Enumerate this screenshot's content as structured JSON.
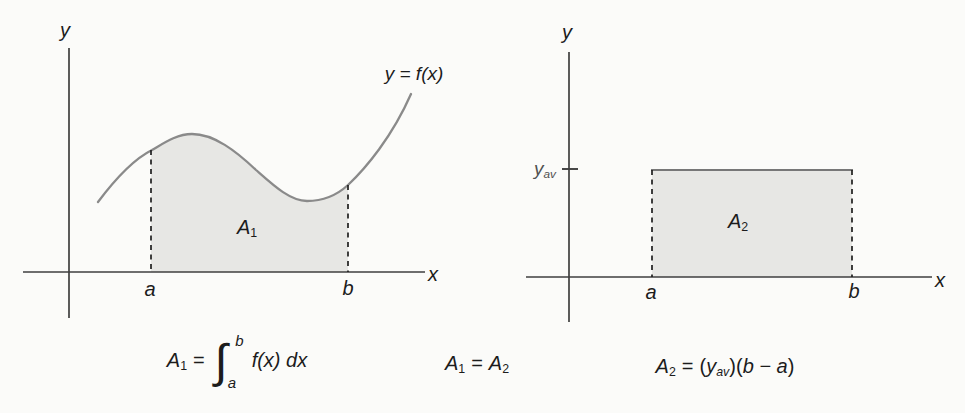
{
  "colors": {
    "background": "#fbfbf9",
    "axis": "#3f3f3f",
    "curve": "#8a8a8a",
    "area_fill": "#e7e7e4",
    "dash": "#1f1f1f",
    "rect_top": "#777777",
    "text": "#1c1c1c",
    "yav_text": "#505050"
  },
  "left_graph": {
    "y_axis_label": "y",
    "x_axis_label": "x",
    "curve_label": "y = f(x)",
    "area_label": "A",
    "area_label_sub": "1",
    "a_label": "a",
    "b_label": "b"
  },
  "right_graph": {
    "y_axis_label": "y",
    "x_axis_label": "x",
    "yav_label": "y",
    "yav_label_sub": "av",
    "area_label": "A",
    "area_label_sub": "2",
    "a_label": "a",
    "b_label": "b"
  },
  "formulas": {
    "integral": {
      "lhs": "A",
      "lhs_sub": "1",
      "equals": "=",
      "int_sign": "∫",
      "upper_limit": "b",
      "lower_limit": "a",
      "integrand": "f(x) dx"
    },
    "equality": {
      "lhs": "A",
      "lhs_sub": "1",
      "equals": "=",
      "rhs": "A",
      "rhs_sub": "2"
    },
    "rect_area": {
      "lhs": "A",
      "lhs_sub": "2",
      "equals": "=",
      "open1": "(",
      "y": "y",
      "y_sub": "av",
      "close1": ")",
      "open2": "(",
      "expr": "b − a",
      "close2": ")"
    }
  }
}
